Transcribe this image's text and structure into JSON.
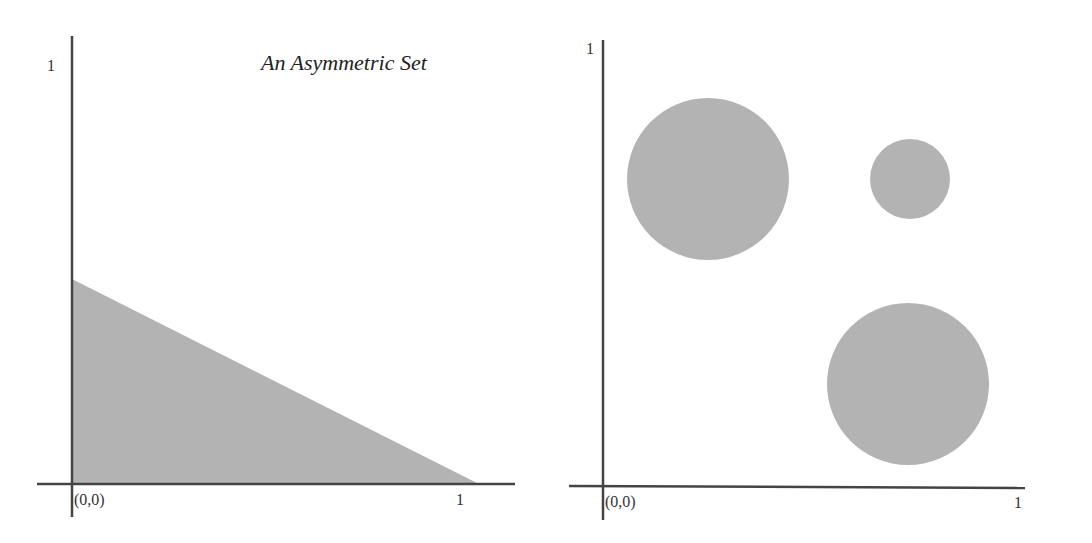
{
  "figures": [
    {
      "name": "asymmetric-set",
      "title": "An Asymmetric Set",
      "origin_label": "(0,0)",
      "x_max_label": "1",
      "y_max_label": "1",
      "shape": "triangle",
      "vertices": [
        [
          0,
          0
        ],
        [
          0,
          0.5
        ],
        [
          1,
          0
        ]
      ]
    },
    {
      "name": "circles-set",
      "title": "",
      "origin_label": "(0,0)",
      "x_max_label": "1",
      "y_max_label": "1",
      "shape": "circles",
      "circles": [
        {
          "cx": 0.25,
          "cy": 0.68,
          "r": 0.18
        },
        {
          "cx": 0.69,
          "cy": 0.68,
          "r": 0.09
        },
        {
          "cx": 0.68,
          "cy": 0.23,
          "r": 0.18
        }
      ]
    }
  ],
  "colors": {
    "axis": "#444444",
    "fill": "#b3b3b3",
    "background": "#ffffff"
  }
}
